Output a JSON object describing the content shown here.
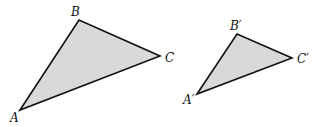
{
  "figure": {
    "fill_color": "#d9d9d9",
    "stroke_color": "#111111",
    "triangles": [
      {
        "name": "ABC",
        "vertices": {
          "A": {
            "label": "A",
            "x": 20,
            "y": 110,
            "lx": 10,
            "ly": 122
          },
          "B": {
            "label": "B",
            "x": 79,
            "y": 20,
            "lx": 71,
            "ly": 16
          },
          "C": {
            "label": "C",
            "x": 160,
            "y": 56,
            "lx": 165,
            "ly": 62
          }
        }
      },
      {
        "name": "A'B'C'",
        "vertices": {
          "A": {
            "label": "A′",
            "x": 197,
            "y": 94,
            "lx": 183,
            "ly": 104
          },
          "B": {
            "label": "B′",
            "x": 237,
            "y": 34,
            "lx": 230,
            "ly": 30
          },
          "C": {
            "label": "C′",
            "x": 292,
            "y": 58,
            "lx": 297,
            "ly": 63
          }
        }
      }
    ]
  }
}
